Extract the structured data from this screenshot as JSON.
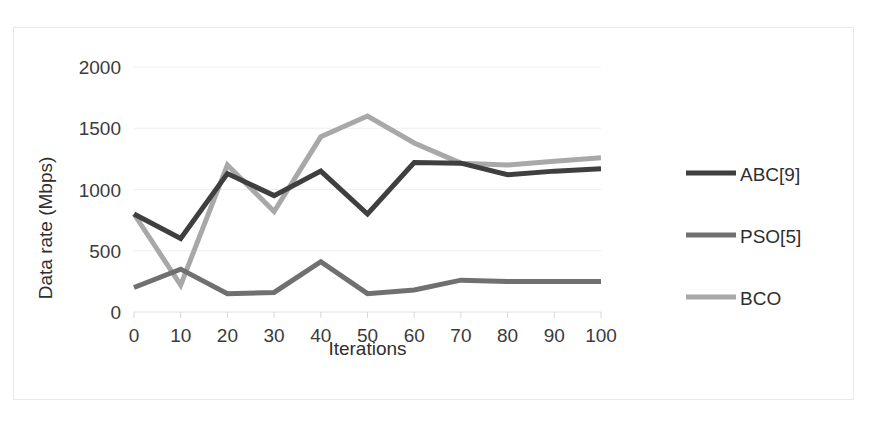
{
  "chart_data": {
    "type": "line",
    "title": "",
    "xlabel": "Iterations",
    "ylabel": "Data rate (Mbps)",
    "x": [
      0,
      10,
      20,
      30,
      40,
      50,
      60,
      70,
      80,
      90,
      100
    ],
    "xtick_labels": [
      "0",
      "10",
      "20",
      "30",
      "40",
      "50",
      "60",
      "70",
      "80",
      "90",
      "100"
    ],
    "ytick_labels": [
      "0",
      "500",
      "1000",
      "1500",
      "2000"
    ],
    "yticks": [
      0,
      500,
      1000,
      1500,
      2000
    ],
    "xlim": [
      0,
      100
    ],
    "ylim": [
      0,
      2000
    ],
    "grid": true,
    "legend_position": "right",
    "series": [
      {
        "name": "ABC[9]",
        "color": "#3f3f3f",
        "values": [
          800,
          600,
          1130,
          950,
          1150,
          800,
          1220,
          1215,
          1120,
          1150,
          1170
        ]
      },
      {
        "name": "PSO[5]",
        "color": "#707070",
        "values": [
          200,
          350,
          150,
          160,
          410,
          150,
          180,
          260,
          250,
          250,
          250
        ]
      },
      {
        "name": "BCO",
        "color": "#a8a8a8",
        "values": [
          800,
          220,
          1200,
          820,
          1430,
          1600,
          1380,
          1215,
          1200,
          1230,
          1260
        ]
      }
    ]
  },
  "legend": {
    "items": [
      {
        "label": "ABC[9]",
        "color": "#3f3f3f"
      },
      {
        "label": "PSO[5]",
        "color": "#707070"
      },
      {
        "label": "BCO",
        "color": "#a8a8a8"
      }
    ]
  }
}
